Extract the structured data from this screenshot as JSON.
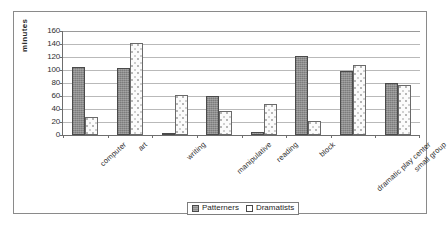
{
  "chart_data": {
    "type": "bar",
    "title": "",
    "xlabel": "",
    "ylabel": "minutes",
    "ylim": [
      0,
      160
    ],
    "yticks": [
      0,
      20,
      40,
      60,
      80,
      100,
      120,
      140,
      160
    ],
    "grid": true,
    "legend_position": "bottom",
    "categories": [
      "computer",
      "art",
      "writing",
      "manipulative",
      "reading",
      "block",
      "dramatic play center",
      "small group"
    ],
    "series": [
      {
        "name": "Patterners",
        "fill": "gray-hatch",
        "color": "#8d8d8d",
        "values": [
          105,
          103,
          3,
          60,
          5,
          122,
          98,
          80
        ]
      },
      {
        "name": "Dramatists",
        "fill": "white-dotted",
        "color": "#fbfbfb",
        "values": [
          27,
          142,
          62,
          37,
          47,
          22,
          107,
          77
        ]
      }
    ]
  },
  "legend": {
    "items": [
      {
        "label": "Patterners"
      },
      {
        "label": "Dramatists"
      }
    ]
  }
}
